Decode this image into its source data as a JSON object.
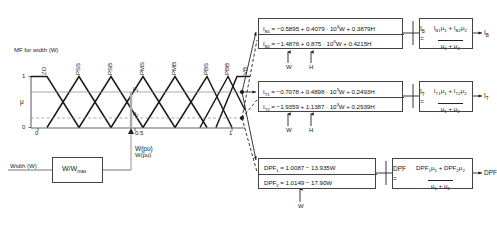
{
  "chart": {
    "title": "MF for width (W)",
    "ylabel": "μ",
    "xlabel": "W(pu)",
    "y_ticks": [
      "0",
      "1"
    ],
    "x_ticks": [
      "0",
      "0.5",
      "1"
    ],
    "mf_labels": [
      "ZO",
      "PSS",
      "PSB",
      "PMS",
      "PMB",
      "PBS",
      "PBB",
      "VB"
    ],
    "mu1_label": "μ",
    "mu1_sub": "1",
    "mu2_label": "μ",
    "mu2_sub": "2"
  },
  "input_block": {
    "input_label": "Width  (W)",
    "box_label": "W/W",
    "box_label_sub": "max",
    "output_label": "W(pu)"
  },
  "rule_boxes": [
    {
      "name": "ib-rule-box",
      "lines": [
        {
          "lhs": "I",
          "lhs_sub": "B1",
          "rhs": " = −0.5895 + 0.4079 · 10",
          "exp": "3",
          "rhs2": "W + 0.3879H"
        },
        {
          "lhs": "I",
          "lhs_sub": "B2",
          "rhs": " = −1.4876 + 0.875 · 10",
          "exp": "3",
          "rhs2": "W + 0.4215H"
        }
      ],
      "inputs": [
        "W",
        "H"
      ]
    },
    {
      "name": "it-rule-box",
      "lines": [
        {
          "lhs": "I",
          "lhs_sub": "T1",
          "rhs": " = −0.7078 + 0.4898 · 10",
          "exp": "3",
          "rhs2": "W + 0.2493H"
        },
        {
          "lhs": "I",
          "lhs_sub": "T2",
          "rhs": " = −1.9359 + 1.1387 · 10",
          "exp": "3",
          "rhs2": "W + 0.2939H"
        }
      ],
      "inputs": [
        "W",
        "H"
      ]
    },
    {
      "name": "dpf-rule-box",
      "lines": [
        {
          "lhs": "DPF",
          "lhs_sub": "1",
          "rhs": " = 1.0087 − 13.935W",
          "exp": "",
          "rhs2": ""
        },
        {
          "lhs": "DPF",
          "lhs_sub": "2",
          "rhs": " = 1.0149 − 17.90W",
          "exp": "",
          "rhs2": ""
        }
      ],
      "inputs": [
        "W"
      ]
    }
  ],
  "defuzz_boxes": [
    {
      "name": "ib-defuzz-box",
      "lhs": "I",
      "lhs_sub": "B",
      "numerator": "Iᴮ₁μ₁ + Iᴮ₂μ₂",
      "num_parts": [
        {
          "v": "I",
          "sub": "B1"
        },
        {
          "v": "μ",
          "sub": "1"
        },
        {
          "v": " + ",
          "sub": ""
        },
        {
          "v": "I",
          "sub": "B2"
        },
        {
          "v": "μ",
          "sub": "2"
        }
      ],
      "den_parts": [
        {
          "v": "μ",
          "sub": "1"
        },
        {
          "v": " + ",
          "sub": ""
        },
        {
          "v": "μ",
          "sub": "2"
        }
      ],
      "output": "I",
      "output_sub": "B"
    },
    {
      "name": "it-defuzz-box",
      "lhs": "I",
      "lhs_sub": "T",
      "num_parts": [
        {
          "v": "I",
          "sub": "T1"
        },
        {
          "v": "μ",
          "sub": "1"
        },
        {
          "v": " + ",
          "sub": ""
        },
        {
          "v": "I",
          "sub": "T2"
        },
        {
          "v": "μ",
          "sub": "2"
        }
      ],
      "den_parts": [
        {
          "v": "μ",
          "sub": "1"
        },
        {
          "v": " + ",
          "sub": ""
        },
        {
          "v": "μ",
          "sub": "2"
        }
      ],
      "output": "I",
      "output_sub": "T"
    },
    {
      "name": "dpf-defuzz-box",
      "lhs": "DPF",
      "lhs_sub": "",
      "num_parts": [
        {
          "v": "DPF",
          "sub": "1"
        },
        {
          "v": "μ",
          "sub": "1"
        },
        {
          "v": " + ",
          "sub": ""
        },
        {
          "v": "DPF",
          "sub": "2"
        },
        {
          "v": "μ",
          "sub": "2"
        }
      ],
      "den_parts": [
        {
          "v": "μ",
          "sub": "1"
        },
        {
          "v": " + ",
          "sub": ""
        },
        {
          "v": "μ",
          "sub": "2"
        }
      ],
      "output": "DPF",
      "output_sub": ""
    }
  ],
  "colors": {
    "line": "#222222",
    "thin": "#777777",
    "box": "#444444",
    "bg": "#ffffff"
  }
}
